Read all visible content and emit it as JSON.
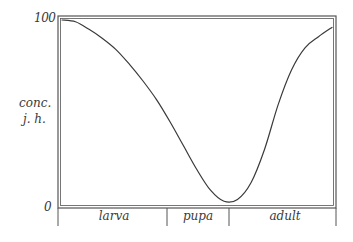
{
  "chart_data": {
    "type": "line",
    "title": "",
    "xlabel": "",
    "ylabel": "conc. j. h.",
    "ylabel_lines": [
      "conc.",
      "j. h."
    ],
    "y_ticks": [
      "100",
      "0"
    ],
    "ylim": [
      0,
      100
    ],
    "grid": false,
    "legend": null,
    "x_segments": [
      {
        "label": "larva",
        "start": 0.0,
        "end": 0.39
      },
      {
        "label": "pupa",
        "start": 0.39,
        "end": 0.61
      },
      {
        "label": "adult",
        "start": 0.61,
        "end": 1.0
      }
    ],
    "series": [
      {
        "name": "juvenile hormone concentration",
        "x": [
          0.0,
          0.05,
          0.1,
          0.15,
          0.2,
          0.25,
          0.3,
          0.35,
          0.4,
          0.45,
          0.5,
          0.55,
          0.6,
          0.65,
          0.7,
          0.75,
          0.8,
          0.85,
          0.9,
          0.95,
          1.0
        ],
        "values": [
          100,
          99,
          95,
          90,
          84,
          76,
          67,
          57,
          45,
          32,
          19,
          8,
          2,
          3,
          12,
          30,
          54,
          73,
          85,
          91,
          96
        ]
      }
    ]
  },
  "labels": {
    "y_top": "100",
    "y_bottom": "0",
    "y_axis_line1": "conc.",
    "y_axis_line2": "j. h.",
    "stage_larva": "larva",
    "stage_pupa": "pupa",
    "stage_adult": "adult"
  },
  "colors": {
    "line": "#3a3a3a",
    "frame": "#555555",
    "background": "#ffffff"
  }
}
